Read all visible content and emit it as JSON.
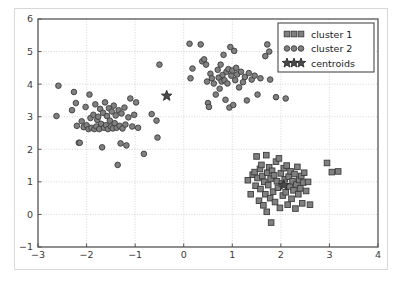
{
  "figure": {
    "background_color": "#ffffff",
    "frame_color": "#d8d8d8",
    "axes_color": "#555555",
    "grid_color": "#cccccc",
    "marker_face_color": "#808080",
    "marker_edge_color": "#3c3c3c",
    "centroid_color": "#4a4a4a"
  },
  "legend": {
    "position": "upper right",
    "border_color": "#4a4a4a",
    "background": "#ffffff",
    "entries": [
      {
        "label": "cluster 1",
        "marker": "square",
        "icon_name": "square-marker-icon"
      },
      {
        "label": "cluster 2",
        "marker": "circle",
        "icon_name": "circle-marker-icon"
      },
      {
        "label": "centroids",
        "marker": "star",
        "icon_name": "star-marker-icon"
      }
    ]
  },
  "chart_data": {
    "type": "scatter",
    "title": "",
    "xlabel": "",
    "ylabel": "",
    "xlim": [
      -3,
      4
    ],
    "ylim": [
      -1,
      6
    ],
    "xticks": [
      -3,
      -2,
      -1,
      0,
      1,
      2,
      3,
      4
    ],
    "yticks": [
      -1,
      0,
      1,
      2,
      3,
      4,
      5,
      6
    ],
    "xtick_labels": [
      "−3",
      "−2",
      "−1",
      "0",
      "1",
      "2",
      "3",
      "4"
    ],
    "ytick_labels": [
      "−1",
      "0",
      "1",
      "2",
      "3",
      "4",
      "5",
      "6"
    ],
    "grid": true,
    "grid_style": "dotted",
    "legend_position": "upper right",
    "series": [
      {
        "name": "cluster 1",
        "marker": "square",
        "color": "#808080",
        "edge_color": "#3c3c3c",
        "size": 5.6,
        "points": [
          [
            1.32,
            1.05
          ],
          [
            1.38,
            0.62
          ],
          [
            1.42,
            1.22
          ],
          [
            1.46,
            1.3
          ],
          [
            1.48,
            0.88
          ],
          [
            1.5,
            1.78
          ],
          [
            1.52,
            1.12
          ],
          [
            1.55,
            0.42
          ],
          [
            1.57,
            1.4
          ],
          [
            1.58,
            0.78
          ],
          [
            1.6,
            1.52
          ],
          [
            1.62,
            1.18
          ],
          [
            1.64,
            0.28
          ],
          [
            1.66,
            1.0
          ],
          [
            1.68,
            0.62
          ],
          [
            1.7,
            1.82
          ],
          [
            1.71,
            0.08
          ],
          [
            1.72,
            1.28
          ],
          [
            1.74,
            0.9
          ],
          [
            1.76,
            1.45
          ],
          [
            1.78,
            0.5
          ],
          [
            1.79,
            1.1
          ],
          [
            1.8,
            -0.25
          ],
          [
            1.82,
            1.34
          ],
          [
            1.84,
            0.7
          ],
          [
            1.86,
            1.2
          ],
          [
            1.88,
            0.38
          ],
          [
            1.9,
            1.62
          ],
          [
            1.92,
            1.02
          ],
          [
            1.94,
            0.82
          ],
          [
            1.96,
            1.72
          ],
          [
            1.98,
            0.2
          ],
          [
            2.0,
            1.26
          ],
          [
            2.02,
            0.95
          ],
          [
            2.04,
            0.58
          ],
          [
            2.06,
            1.42
          ],
          [
            2.08,
            1.08
          ],
          [
            2.1,
            0.68
          ],
          [
            2.12,
            1.5
          ],
          [
            2.14,
            0.3
          ],
          [
            2.16,
            1.16
          ],
          [
            2.18,
            0.86
          ],
          [
            2.2,
            1.32
          ],
          [
            2.22,
            0.48
          ],
          [
            2.24,
            1.02
          ],
          [
            2.26,
            0.74
          ],
          [
            2.28,
            1.24
          ],
          [
            2.3,
            0.18
          ],
          [
            2.32,
            0.92
          ],
          [
            2.34,
            1.46
          ],
          [
            2.36,
            0.62
          ],
          [
            2.38,
            1.06
          ],
          [
            2.4,
            0.8
          ],
          [
            2.42,
            1.18
          ],
          [
            2.44,
            0.34
          ],
          [
            2.46,
            0.98
          ],
          [
            2.48,
            1.28
          ],
          [
            2.52,
            0.72
          ],
          [
            2.56,
            1.0
          ],
          [
            2.6,
            0.3
          ],
          [
            2.95,
            1.58
          ],
          [
            3.05,
            1.3
          ],
          [
            3.18,
            1.32
          ]
        ]
      },
      {
        "name": "cluster 2",
        "marker": "circle",
        "color": "#808080",
        "edge_color": "#3c3c3c",
        "size": 5.6,
        "points": [
          [
            -2.58,
            3.95
          ],
          [
            -2.62,
            3.02
          ],
          [
            -2.3,
            3.2
          ],
          [
            -2.26,
            3.76
          ],
          [
            -2.22,
            3.42
          ],
          [
            -2.2,
            2.72
          ],
          [
            -2.16,
            2.2
          ],
          [
            -2.14,
            2.2
          ],
          [
            -2.1,
            2.86
          ],
          [
            -2.06,
            2.68
          ],
          [
            -2.02,
            3.3
          ],
          [
            -2.0,
            2.74
          ],
          [
            -1.96,
            2.62
          ],
          [
            -1.94,
            3.68
          ],
          [
            -1.92,
            2.96
          ],
          [
            -1.9,
            2.66
          ],
          [
            -1.86,
            3.06
          ],
          [
            -1.84,
            2.62
          ],
          [
            -1.82,
            3.38
          ],
          [
            -1.8,
            2.7
          ],
          [
            -1.78,
            2.9
          ],
          [
            -1.76,
            3.0
          ],
          [
            -1.74,
            2.62
          ],
          [
            -1.72,
            3.24
          ],
          [
            -1.7,
            2.78
          ],
          [
            -1.68,
            2.06
          ],
          [
            -1.66,
            3.12
          ],
          [
            -1.64,
            2.66
          ],
          [
            -1.62,
            3.44
          ],
          [
            -1.6,
            2.74
          ],
          [
            -1.58,
            3.02
          ],
          [
            -1.56,
            2.62
          ],
          [
            -1.54,
            3.26
          ],
          [
            -1.52,
            2.88
          ],
          [
            -1.5,
            2.7
          ],
          [
            -1.48,
            3.16
          ],
          [
            -1.46,
            2.64
          ],
          [
            -1.44,
            3.34
          ],
          [
            -1.42,
            2.8
          ],
          [
            -1.4,
            3.04
          ],
          [
            -1.38,
            2.66
          ],
          [
            -1.36,
            1.52
          ],
          [
            -1.34,
            3.2
          ],
          [
            -1.32,
            2.72
          ],
          [
            -1.3,
            2.18
          ],
          [
            -1.28,
            3.1
          ],
          [
            -1.26,
            2.64
          ],
          [
            -1.22,
            3.28
          ],
          [
            -1.2,
            2.76
          ],
          [
            -1.18,
            2.12
          ],
          [
            -1.14,
            2.98
          ],
          [
            -1.1,
            3.56
          ],
          [
            -1.06,
            2.7
          ],
          [
            -1.02,
            3.06
          ],
          [
            -0.98,
            3.44
          ],
          [
            -0.94,
            2.66
          ],
          [
            -0.82,
            1.86
          ],
          [
            -0.66,
            3.08
          ],
          [
            -0.56,
            2.88
          ],
          [
            -0.54,
            2.36
          ],
          [
            -0.5,
            4.6
          ],
          [
            0.12,
            5.24
          ],
          [
            0.14,
            4.18
          ],
          [
            0.18,
            4.48
          ],
          [
            0.35,
            5.22
          ],
          [
            0.38,
            4.7
          ],
          [
            0.42,
            4.76
          ],
          [
            0.46,
            4.6
          ],
          [
            0.48,
            4.08
          ],
          [
            0.5,
            3.42
          ],
          [
            0.52,
            3.3
          ],
          [
            0.55,
            4.32
          ],
          [
            0.58,
            4.18
          ],
          [
            0.62,
            4.02
          ],
          [
            0.66,
            3.68
          ],
          [
            0.7,
            4.44
          ],
          [
            0.72,
            4.2
          ],
          [
            0.74,
            3.86
          ],
          [
            0.76,
            4.6
          ],
          [
            0.78,
            4.08
          ],
          [
            0.8,
            4.28
          ],
          [
            0.82,
            4.9
          ],
          [
            0.84,
            4.12
          ],
          [
            0.86,
            3.52
          ],
          [
            0.88,
            4.38
          ],
          [
            0.9,
            4.02
          ],
          [
            0.92,
            4.46
          ],
          [
            0.94,
            3.28
          ],
          [
            0.96,
            5.14
          ],
          [
            0.98,
            4.26
          ],
          [
            1.0,
            4.42
          ],
          [
            1.02,
            3.36
          ],
          [
            1.04,
            5.02
          ],
          [
            1.06,
            4.12
          ],
          [
            1.08,
            4.5
          ],
          [
            1.1,
            4.3
          ],
          [
            1.14,
            3.9
          ],
          [
            1.18,
            4.38
          ],
          [
            1.22,
            4.06
          ],
          [
            1.26,
            4.22
          ],
          [
            1.3,
            3.5
          ],
          [
            1.34,
            4.34
          ],
          [
            1.4,
            4.14
          ],
          [
            1.46,
            4.26
          ],
          [
            1.52,
            3.68
          ],
          [
            1.58,
            4.18
          ],
          [
            1.68,
            4.86
          ],
          [
            1.72,
            5.22
          ],
          [
            1.76,
            5.0
          ],
          [
            1.78,
            4.14
          ],
          [
            1.9,
            3.6
          ],
          [
            2.1,
            3.56
          ]
        ]
      },
      {
        "name": "centroids",
        "marker": "star",
        "color": "#4a4a4a",
        "edge_color": "#2a2a2a",
        "size": 11,
        "points": [
          [
            -0.35,
            3.64
          ],
          [
            2.06,
            0.9
          ]
        ]
      }
    ]
  }
}
